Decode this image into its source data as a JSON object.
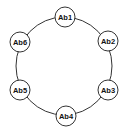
{
  "diagram": {
    "type": "ring",
    "ring": {
      "cx": 64,
      "cy": 66,
      "rx": 48,
      "ry": 49,
      "stroke": "#333333"
    },
    "node_radius": 10,
    "node_fill": "#ffffff",
    "node_stroke": "#333333",
    "nodes": [
      {
        "label": "Ab1",
        "cx": 65,
        "cy": 17
      },
      {
        "label": "Ab2",
        "cx": 108,
        "cy": 41
      },
      {
        "label": "Ab3",
        "cx": 108,
        "cy": 90
      },
      {
        "label": "Ab4",
        "cx": 66,
        "cy": 116
      },
      {
        "label": "Ab5",
        "cx": 20,
        "cy": 90
      },
      {
        "label": "Ab6",
        "cx": 20,
        "cy": 42
      }
    ]
  }
}
